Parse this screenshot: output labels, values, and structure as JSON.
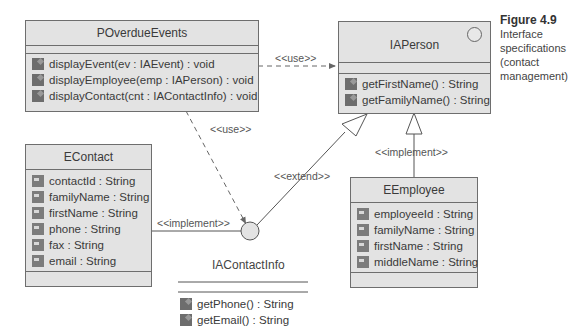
{
  "figure": {
    "number": "Figure 4.9",
    "caption_lines": [
      "Interface",
      "specifications",
      "(contact",
      "management)"
    ]
  },
  "classes": {
    "poverdue": {
      "name": "POverdueEvents",
      "operations": [
        "displayEvent(ev : IAEvent) : void",
        "displayEmployee(emp : IAPerson) : void",
        "displayContact(cnt : IAContactInfo) : void"
      ]
    },
    "iaperson": {
      "name": "IAPerson",
      "operations": [
        "getFirstName() : String",
        "getFamilyName() : String"
      ]
    },
    "econtact": {
      "name": "EContact",
      "attributes": [
        "contactId : String",
        "familyName : String",
        "firstName : String",
        "phone : String",
        "fax : String",
        "email : String"
      ]
    },
    "eemployee": {
      "name": "EEmployee",
      "attributes": [
        "employeeId : String",
        "familyName : String",
        "firstName : String",
        "middleName : String"
      ]
    },
    "iacontactinfo": {
      "name": "IAContactInfo",
      "operations": [
        "getPhone() : String",
        "getEmail() : String"
      ]
    }
  },
  "relations": {
    "use1": "<<use>>",
    "use2": "<<use>>",
    "implement1": "<<implement>>",
    "implement2": "<<implement>>",
    "extend": "<<extend>>"
  },
  "colors": {
    "box_fill": "#e3e3e3",
    "border": "#6e6e6e",
    "icon": "#6d6d6d"
  }
}
